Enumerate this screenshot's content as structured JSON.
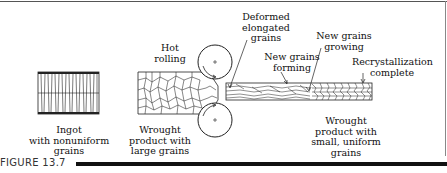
{
  "figure": {
    "label": "FIGURE 13.7"
  },
  "labels": {
    "ingot": [
      "Ingot",
      "with nonuniform",
      "grains"
    ],
    "hot_rolling": [
      "Hot",
      "rolling"
    ],
    "deformed": [
      "Deformed",
      "elongated",
      "grains"
    ],
    "new_forming": [
      "New grains",
      "forming"
    ],
    "new_growing": [
      "New grains",
      "growing"
    ],
    "recryst": [
      "Recrystallization",
      "complete"
    ],
    "wrought_large": [
      "Wrought",
      "product with",
      "large grains"
    ],
    "wrought_small": [
      "Wrought",
      "product with",
      "small, uniform",
      "grains"
    ]
  },
  "colors": {
    "ink": "#111111",
    "background": "#ffffff"
  }
}
